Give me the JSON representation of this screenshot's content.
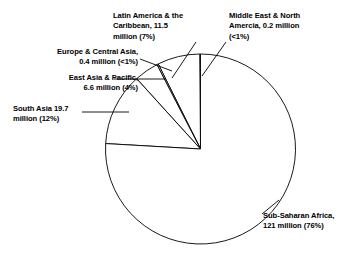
{
  "chart_data": {
    "type": "pie",
    "title": "",
    "subtitle": "",
    "xlabel": "",
    "ylabel": "",
    "units": "million",
    "total": 159.4,
    "legend_position": "none",
    "grid": false,
    "start_angle_deg": 90,
    "direction": "counterclockwise",
    "categories": [
      "Middle East & North Amercia",
      "Latin America & the Caribbean",
      "Europe & Central Asia",
      "East Asia & Pacific",
      "South Asia",
      "Sub-Saharan Africa"
    ],
    "values": [
      0.2,
      11.5,
      0.4,
      6.6,
      19.7,
      121
    ],
    "percent_labels": [
      "<1%",
      "7%",
      "<1%",
      "4%",
      "12%",
      "76%"
    ],
    "percents": [
      0.13,
      7.2,
      0.25,
      4.1,
      12.4,
      75.9
    ],
    "slices": [
      {
        "name": "Middle East & North Amercia",
        "value": 0.2,
        "value_label": "0.2 million",
        "percent_label": "<1%",
        "percent": 0.13,
        "label_text": "Middle East & North\nAmercia, 0.2 million\n(<1%)",
        "label_align": "left"
      },
      {
        "name": "Latin America & the Caribbean",
        "value": 11.5,
        "value_label": "11.5 million",
        "percent_label": "7%",
        "percent": 7.2,
        "label_text": "Latin America & the\nCaribbean, 11.5\nmillion (7%)",
        "label_align": "left"
      },
      {
        "name": "Europe & Central Asia",
        "value": 0.4,
        "value_label": "0.4 million",
        "percent_label": "<1%",
        "percent": 0.25,
        "label_text": "Europe & Central Asia,\n0.4 million (<1%)",
        "label_align": "right"
      },
      {
        "name": "East Asia & Pacific",
        "value": 6.6,
        "value_label": "6.6 million",
        "percent_label": "4%",
        "percent": 4.1,
        "label_text": "East Asia & Pacific,\n6.6 million (4%)",
        "label_align": "right"
      },
      {
        "name": "South Asia",
        "value": 19.7,
        "value_label": "19.7 million",
        "percent_label": "12%",
        "percent": 12.4,
        "label_text": "South Asia 19.7\nmillion (12%)",
        "label_align": "left"
      },
      {
        "name": "Sub-Saharan Africa",
        "value": 121,
        "value_label": "121 million",
        "percent_label": "76%",
        "percent": 75.9,
        "label_text": "Sub-Saharan Africa,\n121 million (76%)",
        "label_align": "left"
      }
    ],
    "colors": {
      "slice_fill": "#ffffff",
      "slice_stroke": "#000000",
      "label_text": "#000000",
      "leader_line": "#000000",
      "background": "#ffffff"
    }
  }
}
